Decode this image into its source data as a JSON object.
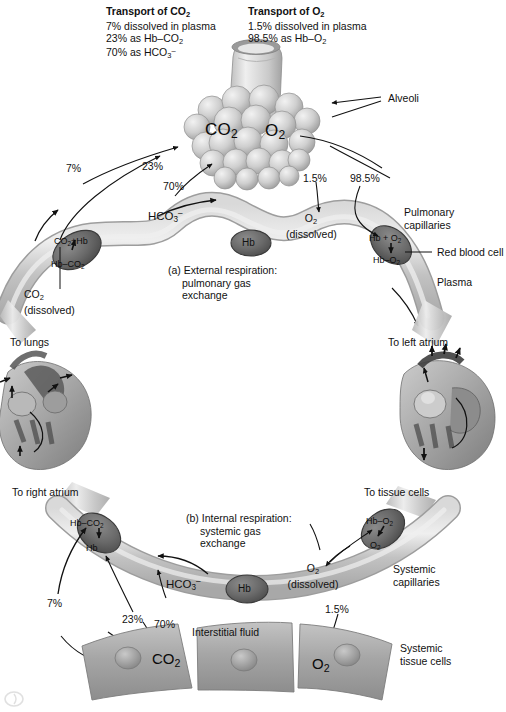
{
  "figure": {
    "title_left": "Transport of CO",
    "title_left_sub": "2",
    "title_right": "Transport of O",
    "title_right_sub": "2",
    "co2_facts": [
      "7% dissolved in plasma",
      "23% as Hb–CO2",
      "70% as HCO3⁻"
    ],
    "o2_facts": [
      "1.5% dissolved in plasma",
      "98.5% as Hb–O2"
    ]
  },
  "panel_a": {
    "caption_line1": "(a) External respiration:",
    "caption_line2": "pulmonary gas",
    "caption_line3": "exchange",
    "alveoli_label": "Alveoli",
    "gas_co2": "CO",
    "gas_co2_sub": "2",
    "gas_o2": "O",
    "gas_o2_sub": "2",
    "pct_7": "7%",
    "pct_23": "23%",
    "pct_70": "70%",
    "pct_1_5": "1.5%",
    "pct_98_5": "98.5%",
    "bicarbonate": "HCO3⁻",
    "rbc_left_top": "CO2+Hb",
    "rbc_left_bottom": "Hb–CO2",
    "rbc_center": "Hb",
    "rbc_right_top": "Hb + O2",
    "rbc_right_bottom": "Hb–O2",
    "o2_dissolved_line1": "O2",
    "o2_dissolved_line2": "(dissolved)",
    "co2_dissolved_line1": "CO2",
    "co2_dissolved_line2": "(dissolved)",
    "pulmonary_capillaries_line1": "Pulmonary",
    "pulmonary_capillaries_line2": "capillaries",
    "red_blood_cell": "Red blood cell",
    "plasma": "Plasma",
    "to_lungs": "To lungs",
    "to_left_atrium": "To left atrium"
  },
  "panel_b": {
    "caption_line1": "(b) Internal respiration:",
    "caption_line2": "systemic gas",
    "caption_line3": "exchange",
    "to_right_atrium": "To right atrium",
    "to_tissue_cells": "To tissue cells",
    "pct_7": "7%",
    "pct_23": "23%",
    "pct_70": "70%",
    "pct_1_5": "1.5%",
    "bicarbonate": "HCO3⁻",
    "rbc_left_top": "Hb–CO2",
    "rbc_left_bottom": "Hb",
    "rbc_center": "Hb",
    "rbc_right_top": "Hb–O2",
    "rbc_right_bottom": "O2",
    "o2_dissolved_line1": "O2",
    "o2_dissolved_line2": "(dissolved)",
    "systemic_capillaries_line1": "Systemic",
    "systemic_capillaries_line2": "capillaries",
    "interstitial_fluid": "Interstitial fluid",
    "tissue_co2": "CO2",
    "tissue_o2": "O2",
    "systemic_tissue_cells_line1": "Systemic",
    "systemic_tissue_cells_line2": "tissue cells"
  },
  "colors": {
    "capillary": "#c4c4c4",
    "capillary_light": "#e2e2e2",
    "rbc": "#6f6f6f",
    "rbc_dark": "#4e4e4e",
    "alveoli": "#c9c9c9",
    "tissue": "#a9a9a9",
    "heart_dark": "#4a4a4a",
    "stroke": "#1a1a1a",
    "text": "#111111"
  }
}
